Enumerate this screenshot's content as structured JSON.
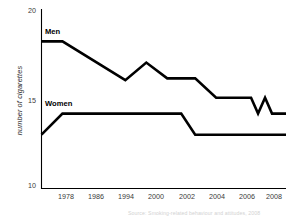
{
  "chart_data": {
    "type": "line",
    "title": "",
    "xlabel": "",
    "ylabel": "number of cigarettes",
    "ylim": [
      10,
      20
    ],
    "yticks": [
      10,
      15,
      20
    ],
    "ytick_labels": [
      "10",
      "15",
      "20"
    ],
    "xtick_labels": [
      "1978",
      "1986",
      "1994",
      "2000",
      "2002",
      "2004",
      "2006",
      "2008"
    ],
    "grid": false,
    "legend_position": "inline-labels",
    "series": [
      {
        "name": "Men",
        "label": "Men",
        "color": "#000000",
        "x": [
          1974,
          1977,
          1986,
          1989,
          1992,
          1996,
          1999,
          2004,
          2005,
          2006,
          2007,
          2009
        ],
        "values": [
          18.3,
          18.3,
          16.1,
          17.1,
          16.2,
          16.2,
          15.1,
          15.1,
          14.2,
          15.1,
          14.2,
          14.2
        ]
      },
      {
        "name": "Women",
        "label": "Women",
        "color": "#000000",
        "x": [
          1974,
          1977,
          1994,
          1996,
          2009
        ],
        "values": [
          13.0,
          14.2,
          14.2,
          13.0,
          13.0
        ]
      }
    ],
    "annotations": [
      "Men",
      "Women"
    ],
    "source_note": "Source: Smoking-related behaviour and attitudes, 2008"
  },
  "axis": {
    "y_title": "number of cigarettes",
    "y_ticks": [
      {
        "label": "20"
      },
      {
        "label": "15"
      },
      {
        "label": "10"
      }
    ],
    "x_ticks": [
      {
        "label": "1978"
      },
      {
        "label": "1986"
      },
      {
        "label": "1994"
      },
      {
        "label": "2000"
      },
      {
        "label": "2002"
      },
      {
        "label": "2004"
      },
      {
        "label": "2006"
      },
      {
        "label": "2008"
      }
    ]
  },
  "labels": {
    "men": "Men",
    "women": "Women"
  },
  "footer": {
    "source": "Source: Smoking-related behaviour and attitudes, 2008"
  },
  "colors": {
    "line": "#000000",
    "axis": "#000000",
    "background": "#ffffff",
    "tick_text": "#3a3a3a"
  }
}
